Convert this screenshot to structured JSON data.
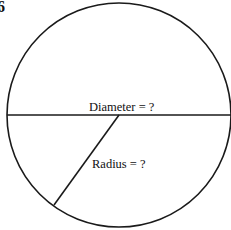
{
  "figure": {
    "number": "6",
    "diameter_label": "Diameter = ?",
    "radius_label": "Radius = ?",
    "colors": {
      "stroke": "#1a1a1a",
      "background": "#ffffff"
    }
  }
}
